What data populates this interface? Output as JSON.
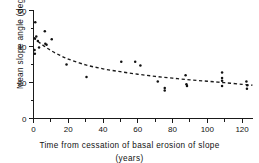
{
  "chart_data": {
    "type": "scatter",
    "title": "",
    "xlabel": "Time from cessation of basal erosion of slope (years)",
    "xlabel_line1": "Time  from  cessation of  basal  erosion  of  slope",
    "xlabel_line2": "(years)",
    "ylabel": "Mean slope angle (degrees)",
    "xlim": [
      0,
      126
    ],
    "ylim": [
      0,
      60
    ],
    "grid": false,
    "legend": "none",
    "x_ticks_major": [
      0,
      20,
      40,
      60,
      80,
      100,
      120
    ],
    "x_ticks_major_labels": [
      "0",
      "20",
      "40",
      "60",
      "80",
      "100",
      "120"
    ],
    "x_ticks_minor": [
      10,
      30,
      50,
      70,
      90,
      110
    ],
    "y_ticks_major": [
      0,
      20,
      40,
      60
    ],
    "y_ticks_major_labels": [
      "0",
      "20",
      "40",
      "60"
    ],
    "y_ticks_minor": [
      10,
      30,
      50
    ],
    "point_marker": "filled-circle",
    "point_color": "#111111",
    "trend_style": "dashed",
    "trend_color": "#1a1a1a",
    "trend_description": "dashed decay curve fitted through scatter",
    "points": [
      {
        "x": 1.0,
        "y": 53.5
      },
      {
        "x": 0.8,
        "y": 44.5
      },
      {
        "x": 1.6,
        "y": 45.5
      },
      {
        "x": 0.6,
        "y": 38.0
      },
      {
        "x": 0.8,
        "y": 36.0
      },
      {
        "x": 2.5,
        "y": 43.0
      },
      {
        "x": 3.2,
        "y": 39.5
      },
      {
        "x": 6.5,
        "y": 48.5
      },
      {
        "x": 6.8,
        "y": 41.5
      },
      {
        "x": 7.5,
        "y": 41.0
      },
      {
        "x": 10.5,
        "y": 44.0
      },
      {
        "x": 19.0,
        "y": 30.0
      },
      {
        "x": 30.5,
        "y": 23.0
      },
      {
        "x": 50.5,
        "y": 31.5
      },
      {
        "x": 58.5,
        "y": 31.5
      },
      {
        "x": 61.5,
        "y": 29.5
      },
      {
        "x": 71.5,
        "y": 20.5
      },
      {
        "x": 75.5,
        "y": 17.0
      },
      {
        "x": 75.5,
        "y": 15.5
      },
      {
        "x": 87.5,
        "y": 24.0
      },
      {
        "x": 88.0,
        "y": 19.0
      },
      {
        "x": 88.3,
        "y": 18.0
      },
      {
        "x": 108.5,
        "y": 25.5
      },
      {
        "x": 108.5,
        "y": 22.5
      },
      {
        "x": 108.5,
        "y": 21.0
      },
      {
        "x": 108.5,
        "y": 18.0
      },
      {
        "x": 122.5,
        "y": 20.5
      },
      {
        "x": 123.0,
        "y": 18.5
      },
      {
        "x": 122.8,
        "y": 16.5
      }
    ],
    "trend_points": [
      {
        "x": 0,
        "y": 45.0
      },
      {
        "x": 5,
        "y": 41.0
      },
      {
        "x": 10,
        "y": 37.8
      },
      {
        "x": 15,
        "y": 35.2
      },
      {
        "x": 20,
        "y": 33.0
      },
      {
        "x": 30,
        "y": 29.8
      },
      {
        "x": 40,
        "y": 27.6
      },
      {
        "x": 50,
        "y": 26.0
      },
      {
        "x": 60,
        "y": 24.6
      },
      {
        "x": 70,
        "y": 23.4
      },
      {
        "x": 80,
        "y": 22.4
      },
      {
        "x": 90,
        "y": 21.5
      },
      {
        "x": 100,
        "y": 20.7
      },
      {
        "x": 110,
        "y": 19.9
      },
      {
        "x": 120,
        "y": 19.0
      },
      {
        "x": 126,
        "y": 18.5
      }
    ]
  }
}
